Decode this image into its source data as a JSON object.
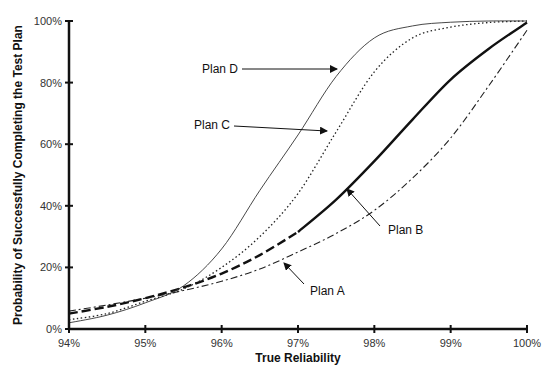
{
  "chart_data": {
    "type": "line",
    "title": "",
    "xlabel": "True Reliability",
    "ylabel": "Probability of Successfully Completing the Test Plan",
    "xlim": [
      94,
      100
    ],
    "ylim": [
      0,
      100
    ],
    "x_ticks": [
      94,
      95,
      96,
      97,
      98,
      99,
      100
    ],
    "x_tick_labels": [
      "94%",
      "95%",
      "96%",
      "97%",
      "98%",
      "99%",
      "100%"
    ],
    "y_ticks": [
      0,
      20,
      40,
      60,
      80,
      100
    ],
    "y_tick_labels": [
      "0%",
      "20%",
      "40%",
      "60%",
      "80%",
      "100%"
    ],
    "grid": false,
    "legend": "none (inline annotations)",
    "x": [
      94,
      94.5,
      95,
      95.5,
      96,
      96.5,
      97,
      97.5,
      98,
      98.5,
      99,
      99.5,
      100
    ],
    "series": [
      {
        "name": "Plan A",
        "style": "dash-dot thin",
        "values": [
          5.8,
          7.8,
          10,
          12.5,
          15.5,
          19.5,
          25,
          31,
          38.5,
          49,
          62,
          79,
          97
        ]
      },
      {
        "name": "Plan B",
        "style": "dashed to solid thick",
        "values": [
          5,
          7.2,
          10,
          13.5,
          18,
          24,
          31.5,
          42,
          54.5,
          68,
          81,
          91,
          99.5
        ]
      },
      {
        "name": "Plan C",
        "style": "dotted",
        "values": [
          3,
          5,
          9,
          13,
          20,
          30,
          44,
          64,
          83.5,
          94.5,
          98,
          99.5,
          100
        ]
      },
      {
        "name": "Plan D",
        "style": "solid thin",
        "values": [
          2,
          4.5,
          8.5,
          14,
          26,
          45,
          63,
          82,
          94.5,
          98.4,
          99.6,
          100,
          100
        ]
      }
    ],
    "annotations": [
      {
        "text": "Plan D",
        "points_to": "Plan D",
        "at_x": 97.5
      },
      {
        "text": "Plan C",
        "points_to": "Plan C",
        "at_x": 97.4
      },
      {
        "text": "Plan B",
        "points_to": "Plan B",
        "at_x": 97.9
      },
      {
        "text": "Plan A",
        "points_to": "Plan A",
        "at_x": 97.0
      }
    ]
  }
}
